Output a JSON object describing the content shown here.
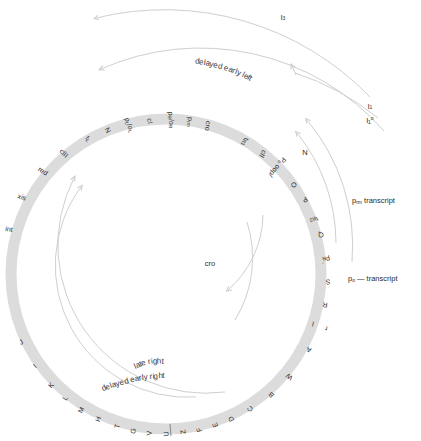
{
  "figure": {
    "type": "circular-genetic-map",
    "organism_map": "bacteriophage lambda circular genome map",
    "ring_color": "#dcdcdc",
    "arc_color": "#cfcfcf",
    "text_color": "#2b2b2b",
    "background": "#ffffff"
  },
  "ring_labels": [
    {
      "id": "int",
      "text": "int",
      "angle": -74,
      "radius": 163,
      "rot": 10
    },
    {
      "id": "xis",
      "text": "xis",
      "angle": -62,
      "radius": 163,
      "rot": 20
    },
    {
      "id": "red",
      "text": "red",
      "angle": -50,
      "radius": 160,
      "rot": 32
    },
    {
      "id": "cIII",
      "text": "cIII",
      "angle": -40,
      "radius": 158,
      "rot": 43
    },
    {
      "id": "tL",
      "text": "t",
      "sub": "L",
      "angle": -30,
      "radius": 156,
      "rot": 53
    },
    {
      "id": "N",
      "text": "N",
      "angle": -22,
      "radius": 155,
      "rot": 62
    },
    {
      "id": "pL-oL",
      "text": "p",
      "sub": "L",
      "text2": "/o",
      "sub2": "L",
      "angle": -14,
      "radius": 154,
      "rot": 70
    },
    {
      "id": "cI",
      "text": "cI",
      "angle": -6,
      "radius": 154,
      "rot": 78
    },
    {
      "id": "pR-oR",
      "text": "p",
      "sub": "R",
      "text2": "/o",
      "sub2": "R",
      "angle": 2,
      "radius": 154,
      "rot": 86
    },
    {
      "id": "prm",
      "text": "p",
      "sub": "rm",
      "angle": 9,
      "radius": 154,
      "rot": 92
    },
    {
      "id": "cro",
      "text": "cro",
      "angle": 16,
      "radius": 154,
      "rot": 99
    },
    {
      "id": "tR1",
      "text": "t",
      "sub": "R1",
      "angle": 31,
      "radius": 154,
      "rot": 114
    },
    {
      "id": "cII",
      "text": "cII",
      "angle": 39,
      "radius": 154,
      "rot": 122
    },
    {
      "id": "po-oop",
      "text": "P",
      "sub": "o",
      "text2": " oop/",
      "angle": 46,
      "radius": 154,
      "rot": 129
    },
    {
      "id": "O",
      "text": "O",
      "angle": 55,
      "radius": 156,
      "rot": 138
    },
    {
      "id": "P",
      "text": "P",
      "angle": 62,
      "radius": 157,
      "rot": 145
    },
    {
      "id": "tR2",
      "text": "t",
      "sub": "R2",
      "angle": 70,
      "radius": 158,
      "rot": 153
    },
    {
      "id": "Q",
      "text": "Q",
      "angle": 76,
      "radius": 160,
      "rot": 160
    },
    {
      "id": "pR-prime",
      "text": "p",
      "sub": "R",
      "sup": "′",
      "angle": 85,
      "radius": 161,
      "rot": 168
    },
    {
      "id": "S",
      "text": "S",
      "angle": 93,
      "radius": 162,
      "rot": 177
    },
    {
      "id": "R",
      "text": "R",
      "angle": 101,
      "radius": 162,
      "rot": 185
    },
    {
      "id": "cos-r",
      "text": "r",
      "angle": 109,
      "radius": 169,
      "rot": 192
    },
    {
      "id": "cos-l",
      "text": "l",
      "angle": 109,
      "radius": 155,
      "rot": 192
    },
    {
      "id": "A",
      "text": "A",
      "angle": 118,
      "radius": 162,
      "rot": 202
    },
    {
      "id": "W",
      "text": "W",
      "angle": 130,
      "radius": 161,
      "rot": 215
    },
    {
      "id": "B",
      "text": "B",
      "angle": 139,
      "radius": 160,
      "rot": 224
    },
    {
      "id": "C",
      "text": "C",
      "angle": 148,
      "radius": 159,
      "rot": 233
    },
    {
      "id": "D",
      "text": "D",
      "angle": 156,
      "radius": 159,
      "rot": 241
    },
    {
      "id": "E",
      "text": "E",
      "angle": 162,
      "radius": 159,
      "rot": 247
    },
    {
      "id": "F",
      "text": "F",
      "angle": 168,
      "radius": 159,
      "rot": 253
    },
    {
      "id": "Z",
      "text": "Z",
      "angle": 174,
      "radius": 159,
      "rot": 259
    },
    {
      "id": "U",
      "text": "U",
      "angle": 180,
      "radius": 160,
      "rot": 265
    },
    {
      "id": "V",
      "text": "V",
      "angle": 186,
      "radius": 160,
      "rot": 271
    },
    {
      "id": "G",
      "text": "G",
      "angle": 192,
      "radius": 160,
      "rot": 277
    },
    {
      "id": "T",
      "text": "T",
      "angle": 198,
      "radius": 160,
      "rot": 283
    },
    {
      "id": "H",
      "text": "H",
      "angle": 205,
      "radius": 160,
      "rot": 290
    },
    {
      "id": "M",
      "text": "M",
      "angle": 212,
      "radius": 160,
      "rot": 297
    },
    {
      "id": "L",
      "text": "L",
      "angle": 219,
      "radius": 160,
      "rot": 304
    },
    {
      "id": "K",
      "text": "K",
      "angle": 226,
      "radius": 160,
      "rot": 311
    },
    {
      "id": "I",
      "text": "I",
      "angle": 235,
      "radius": 160,
      "rot": 320
    },
    {
      "id": "J",
      "text": "J",
      "angle": 245,
      "radius": 160,
      "rot": 330
    }
  ],
  "inner_labels": [
    {
      "id": "cro-transcript-label",
      "text": "cro",
      "x": 210,
      "y": 263
    },
    {
      "id": "N-transcript-label",
      "text": "N",
      "x": 305,
      "y": 152
    }
  ],
  "curved_captions": [
    {
      "id": "delayed-early-left",
      "text": "delayed early left",
      "x": 194,
      "y": 63,
      "rot": 18
    },
    {
      "id": "late-right",
      "text": "late right",
      "x": 133,
      "y": 357,
      "rot": -10
    },
    {
      "id": "delayed-early-right",
      "text": "delayed early right",
      "x": 100,
      "y": 375,
      "rot": -12
    }
  ],
  "side_labels": [
    {
      "id": "prm-transcript",
      "text": "p",
      "sub": "rm",
      "suffix": " transcript",
      "x": 352,
      "y": 196
    },
    {
      "id": "po-transcript",
      "text": "p",
      "sub": "o",
      "suffix": " — transcript",
      "x": 348,
      "y": 274
    }
  ],
  "arc_end_labels": [
    {
      "id": "l3-label",
      "text": "l",
      "sub": "3",
      "x": 283,
      "y": 17
    },
    {
      "id": "l1-label",
      "text": "l",
      "sub": "1",
      "x": 370,
      "y": 106
    },
    {
      "id": "l1o-label",
      "text": "l",
      "sub": "1",
      "sup": "o",
      "x": 370,
      "y": 120
    }
  ],
  "transcript_arcs": [
    {
      "id": "l3-arc",
      "direction": "counterclockwise"
    },
    {
      "id": "delayed-early-left-arc",
      "direction": "counterclockwise"
    },
    {
      "id": "prm-arc",
      "direction": "counterclockwise"
    },
    {
      "id": "po-arc",
      "direction": "counterclockwise"
    },
    {
      "id": "cro-arc",
      "direction": "clockwise"
    },
    {
      "id": "late-right-arc",
      "direction": "clockwise"
    },
    {
      "id": "delayed-early-right-arc",
      "direction": "clockwise"
    }
  ]
}
